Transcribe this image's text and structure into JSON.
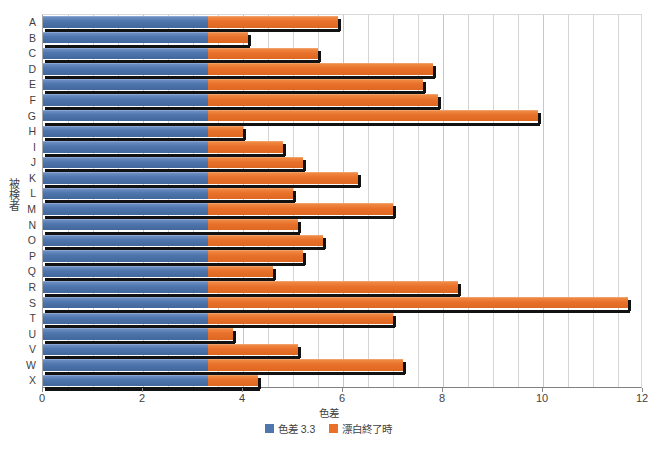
{
  "chart_data": {
    "type": "bar",
    "orientation": "horizontal",
    "stacked": true,
    "title": "",
    "xlabel": "色差",
    "ylabel": "被検者",
    "xlim": [
      0,
      12
    ],
    "xticks": [
      0,
      2,
      4,
      6,
      8,
      10,
      12
    ],
    "xtick_labels": [
      "0",
      "2",
      "4",
      "6",
      "8",
      "10",
      "12"
    ],
    "minor_gridlines": true,
    "minor_grid_step": 0.5,
    "grid": true,
    "legend_position": "bottom",
    "categories": [
      "A",
      "B",
      "C",
      "D",
      "E",
      "F",
      "G",
      "H",
      "I",
      "J",
      "K",
      "L",
      "M",
      "N",
      "O",
      "P",
      "Q",
      "R",
      "S",
      "T",
      "U",
      "V",
      "W",
      "X"
    ],
    "series": [
      {
        "name": "色差 3.3",
        "color": "#4f76ad",
        "values": [
          3.3,
          3.3,
          3.3,
          3.3,
          3.3,
          3.3,
          3.3,
          3.3,
          3.3,
          3.3,
          3.3,
          3.3,
          3.3,
          3.3,
          3.3,
          3.3,
          3.3,
          3.3,
          3.3,
          3.3,
          3.3,
          3.3,
          3.3,
          3.3
        ]
      },
      {
        "name": "漂白終了時",
        "color": "#e8702a",
        "values": [
          5.9,
          4.1,
          5.5,
          7.8,
          7.6,
          7.9,
          9.9,
          4.0,
          4.8,
          5.2,
          6.3,
          5.0,
          7.0,
          5.1,
          5.6,
          5.2,
          4.6,
          8.3,
          11.7,
          7.0,
          3.8,
          5.1,
          7.2,
          4.3
        ]
      }
    ]
  },
  "legend": {
    "items": [
      {
        "label": "色差 3.3",
        "color": "#4f76ad"
      },
      {
        "label": "漂白終了時",
        "color": "#e8702a"
      }
    ]
  }
}
